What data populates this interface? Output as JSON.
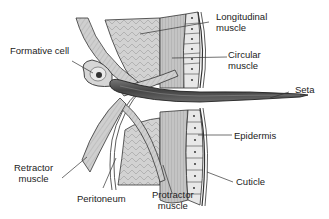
{
  "diagram": {
    "labels": {
      "formative_cell": "Formative cell",
      "longitudinal_muscle_1": "Longitudinal",
      "longitudinal_muscle_2": "muscle",
      "circular_muscle_1": "Circular",
      "circular_muscle_2": "muscle",
      "seta": "Seta",
      "epidermis": "Epidermis",
      "retractor_muscle_1": "Retractor",
      "retractor_muscle_2": "muscle",
      "peritoneum": "Peritoneum",
      "protractor_muscle_1": "Protractor",
      "protractor_muscle_2": "muscle",
      "cuticle": "Cuticle"
    },
    "colors": {
      "background": "#ffffff",
      "muscle_fill": "#c8c8c8",
      "light_fill": "#e6e6e6",
      "seta_fill": "#555555",
      "outline": "#222222"
    }
  }
}
